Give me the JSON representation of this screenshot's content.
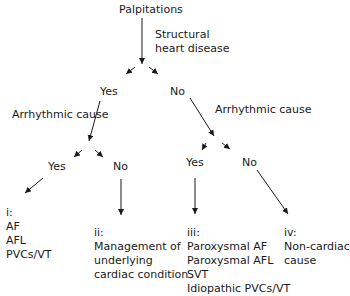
{
  "root": "Palpitations",
  "q1": {
    "line1": "Structural",
    "line2": "heart disease"
  },
  "q1_yes": "Yes",
  "q1_no": "No",
  "q2_left": "Arrhythmic cause",
  "q2_right": "Arrhythmic cause",
  "q2l_yes": "Yes",
  "q2l_no": "No",
  "q2r_yes": "Yes",
  "q2r_no": "No",
  "outcomes": {
    "i": {
      "label": "i:",
      "lines": [
        "AF",
        "AFL",
        "PVCs/VT"
      ]
    },
    "ii": {
      "label": "ii:",
      "lines": [
        "Management of",
        "underlying",
        "cardiac condition"
      ]
    },
    "iii": {
      "label": "iii:",
      "lines": [
        "Paroxysmal AF",
        "Paroxysmal AFL",
        "SVT",
        "Idiopathic PVCs/VT"
      ]
    },
    "iv": {
      "label": "iv:",
      "lines": [
        "Non-cardiac",
        "cause"
      ]
    }
  }
}
